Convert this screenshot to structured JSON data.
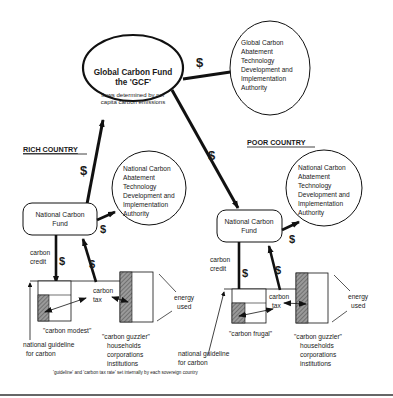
{
  "global": {
    "fund_title_1": "Global Carbon Fund",
    "fund_title_2": "the 'GCF'",
    "fund_note_1": "flows determined by per",
    "fund_note_2": "capita carbon emissions",
    "authority_lines": [
      "Global Carbon",
      "Abatement",
      "Technology",
      "Development and",
      "Implementation",
      "Authority"
    ]
  },
  "symbols": {
    "dollar": "$"
  },
  "rich": {
    "heading": "RICH  COUNTRY",
    "fund_line_1": "National Carbon",
    "fund_line_2": "Fund",
    "authority_lines": [
      "National Carbon",
      "Abatement",
      "Technology",
      "Development and",
      "Implementation",
      "Authority"
    ],
    "credit_1": "carbon",
    "credit_2": "credit",
    "tax_1": "carbon",
    "tax_2": "tax",
    "modest_label": "\"carbon modest\"",
    "guzzler_label": "\"carbon guzzler\"",
    "guzzler_types": [
      "households",
      "corporations",
      "institutions"
    ],
    "guideline_1": "national guideline",
    "guideline_2": "for carbon",
    "energy_1": "energy",
    "energy_2": "used"
  },
  "poor": {
    "heading": "POOR  COUNTRY",
    "fund_line_1": "National Carbon",
    "fund_line_2": "Fund",
    "authority_lines": [
      "National Carbon",
      "Abatement",
      "Technology",
      "Development and",
      "Implementation",
      "Authority"
    ],
    "credit_1": "carbon",
    "credit_2": "credit",
    "tax_1": "carbon",
    "tax_2": "tax",
    "frugal_label": "\"carbon frugal\"",
    "guzzler_label": "\"carbon guzzler\"",
    "guzzler_types": [
      "households",
      "corporations",
      "institutions"
    ],
    "guideline_1": "national guideline",
    "guideline_2": "for carbon",
    "energy_1": "energy",
    "energy_2": "used"
  },
  "footnote": "'guideline' and 'carbon tax rate' set internally by each sovereign country"
}
